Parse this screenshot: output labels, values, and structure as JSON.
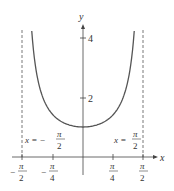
{
  "chart_data": {
    "type": "line",
    "title": "",
    "function": "y = sec x",
    "xlabel": "x",
    "ylabel": "y",
    "xlim": [
      -1.5708,
      1.5708
    ],
    "ylim": [
      0,
      4.3
    ],
    "x_ticks": [
      {
        "value": -1.5708,
        "label_num": "π",
        "label_den": "2",
        "sign": "−"
      },
      {
        "value": -0.7854,
        "label_num": "π",
        "label_den": "4",
        "sign": "−"
      },
      {
        "value": 0.7854,
        "label_num": "π",
        "label_den": "4",
        "sign": ""
      },
      {
        "value": 1.5708,
        "label_num": "π",
        "label_den": "2",
        "sign": ""
      }
    ],
    "y_ticks": [
      {
        "value": 2,
        "label": "2"
      },
      {
        "value": 4,
        "label": "4"
      }
    ],
    "asymptotes": [
      {
        "x": -1.5708,
        "label_lhs": "x = −",
        "label_num": "π",
        "label_den": "2"
      },
      {
        "x": 1.5708,
        "label_lhs": "x = ",
        "label_num": "π",
        "label_den": "2"
      }
    ],
    "series": [
      {
        "name": "sec x",
        "x": [
          -1.33,
          -1.2,
          -1.0,
          -0.785,
          -0.5,
          -0.25,
          0,
          0.25,
          0.5,
          0.785,
          1.0,
          1.2,
          1.33
        ],
        "values": [
          4.2,
          2.76,
          1.85,
          1.414,
          1.14,
          1.03,
          1.0,
          1.03,
          1.14,
          1.414,
          1.85,
          2.76,
          4.2
        ]
      }
    ],
    "grid": false,
    "legend": "none"
  },
  "labels": {
    "x_axis": "x",
    "y_axis": "y",
    "y_tick_2": "2",
    "y_tick_4": "4",
    "neg": "−",
    "pi": "π",
    "two": "2",
    "four": "4",
    "asym_left_lhs": "x = −",
    "asym_right_lhs": "x ="
  }
}
